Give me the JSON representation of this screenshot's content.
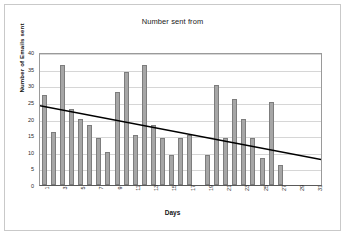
{
  "chart_data": {
    "type": "bar",
    "title": "Number sent from",
    "xlabel": "Days",
    "ylabel": "Number of Emails sent",
    "ylim": [
      0,
      40
    ],
    "ytick_values": [
      0,
      5,
      10,
      15,
      20,
      25,
      30,
      35,
      40
    ],
    "ytick_labels": [
      "0",
      "5",
      "10",
      "15",
      "20",
      "25",
      "30",
      "35",
      "40"
    ],
    "grid": true,
    "legend": false,
    "legend_position": "none",
    "categories": [
      "1",
      "2",
      "3",
      "4",
      "5",
      "6",
      "7",
      "8",
      "9",
      "10",
      "11",
      "12",
      "13",
      "14",
      "15",
      "16",
      "17",
      "18",
      "19",
      "20",
      "21",
      "22",
      "23",
      "24",
      "25",
      "26",
      "27",
      "28",
      "29",
      "30",
      "31"
    ],
    "xtick_labels": [
      "1",
      "",
      "3",
      "",
      "5",
      "",
      "7",
      "",
      "9",
      "",
      "11",
      "",
      "13",
      "",
      "15",
      "",
      "17",
      "",
      "19",
      "",
      "21",
      "",
      "23",
      "",
      "25",
      "",
      "27",
      "",
      "29",
      "",
      "31"
    ],
    "values": [
      27,
      16,
      36,
      23,
      20,
      18,
      14,
      10,
      28,
      34,
      15,
      36,
      18,
      14,
      9,
      14,
      15,
      0,
      9,
      30,
      14,
      26,
      20,
      14,
      8,
      25,
      6,
      0,
      0,
      0,
      0
    ],
    "bar_color": "#a6a6a6",
    "bar_border_color": "#7d7d7d",
    "series": [
      {
        "name": "Number of Emails sent",
        "values": [
          27,
          16,
          36,
          23,
          20,
          18,
          14,
          10,
          28,
          34,
          15,
          36,
          18,
          14,
          9,
          14,
          15,
          0,
          9,
          30,
          14,
          26,
          20,
          14,
          8,
          25,
          6,
          0,
          0,
          0,
          0
        ]
      }
    ],
    "trendline": {
      "type": "linear",
      "color": "#000000",
      "start_value": 24.2,
      "end_value": 7.8
    }
  }
}
